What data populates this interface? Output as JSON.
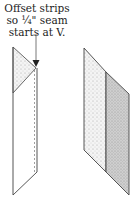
{
  "annotation": {
    "lines": [
      "Offset strips",
      "so ¼\" seam",
      "starts at V."
    ]
  },
  "figure": {
    "left_piece": "offset-strips-with-seam-line",
    "right_piece": "sewn-strip-pair",
    "colors": {
      "outline": "#444444",
      "light_fill": "#e6e6e6",
      "dark_fill": "#c4c4c4",
      "seam": "#777777"
    }
  }
}
